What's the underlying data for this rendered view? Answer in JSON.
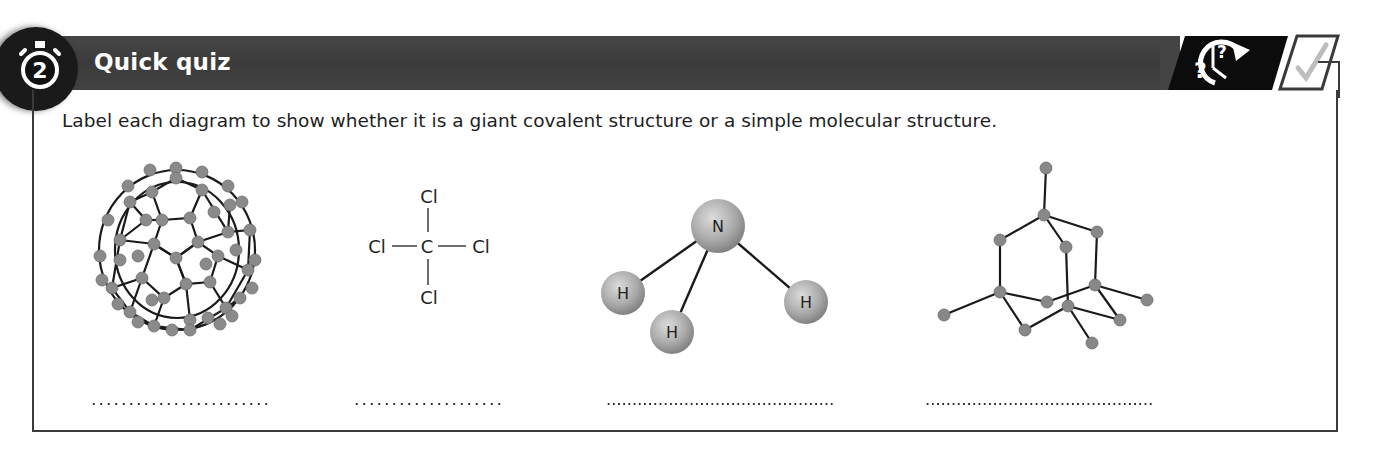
{
  "section": {
    "number": "2",
    "title": "Quick quiz",
    "badge_icon": "stopwatch-icon",
    "header_icons": [
      "clock-question-icon",
      "checkmark-box-icon"
    ]
  },
  "instruction": "Label each diagram to show whether it is a giant covalent structure or a simple molecular structure.",
  "diagrams": [
    {
      "name": "fullerene-c60",
      "type": "ball-and-stick"
    },
    {
      "name": "tetrachloromethane",
      "type": "displayed-formula",
      "atoms": {
        "center": "C",
        "top": "Cl",
        "left": "Cl",
        "right": "Cl",
        "bottom": "Cl"
      }
    },
    {
      "name": "ammonia",
      "type": "ball-and-stick",
      "atoms": {
        "central": "N",
        "h1": "H",
        "h2": "H",
        "h3": "H"
      }
    },
    {
      "name": "diamond-fragment",
      "type": "ball-and-stick"
    }
  ],
  "answers": [
    {
      "value": "",
      "placeholder": "........................"
    },
    {
      "value": "",
      "placeholder": "...................."
    },
    {
      "value": "",
      "placeholder": ".............................."
    },
    {
      "value": "",
      "placeholder": ".............................."
    }
  ]
}
